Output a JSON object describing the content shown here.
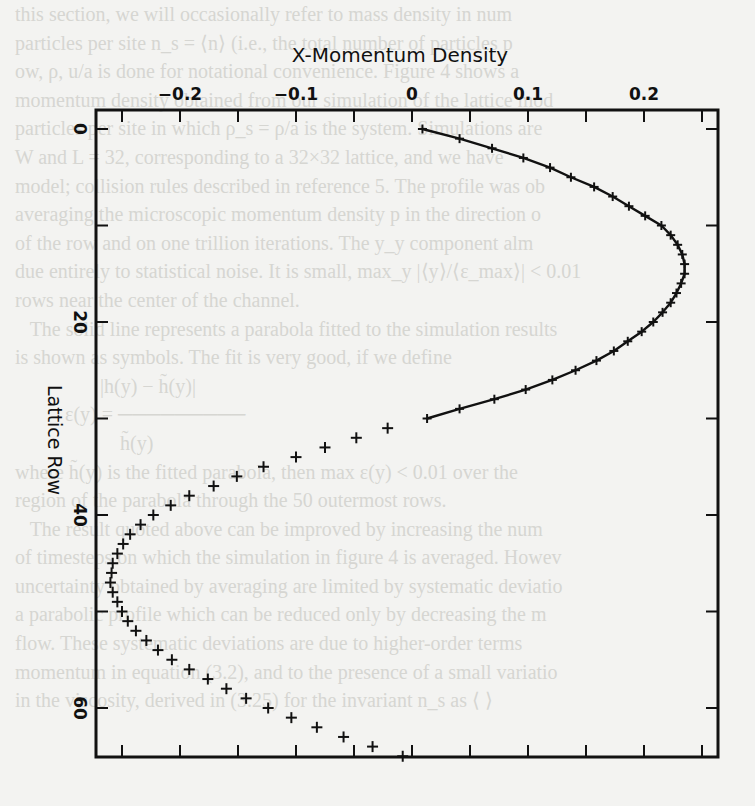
{
  "background_text": [
    "   this section, we will occasionally refer to mass density in num",
    "   particles per site n_s = ⟨n⟩ (i.e., the total number of particles p",
    "   ow, ρ, u/a is done for notational convenience. Figure 4 shows a",
    "   momentum density obtained from our simulation of the lattice mod",
    "   particles per site in which ρ_s = ρ/a is the system. Simulations are",
    "   W and L = 32, corresponding to a 32×32 lattice, and we have",
    "   model; collision rules described in reference 5. The profile was ob",
    "   averaging the microscopic momentum density p in the direction o",
    "   of the row and on one trillion iterations. The y_y component alm",
    "   due entirely to statistical noise. It is small, max_y |⟨y⟩/⟨ε_max⟩| < 0.01",
    "   rows near the center of the channel.",
    "      The solid line represents a parabola fitted to the simulation results",
    "   is shown as symbols. The fit is very good, if we define",
    "                    |h(y) − h̃(y)|",
    "             ε(y) = ─────────",
    "                        h̃(y)",
    "   where h̃(y) is the fitted parabola, then max ε(y) < 0.01 over the",
    "   region of the parabola through the 50 outermost rows.",
    "      The result quoted above can be improved by increasing the num",
    "   of timesteps on which the simulation in figure 4 is averaged. Howev",
    "   uncertainty obtained by averaging are limited by systematic deviatio",
    "   a parabolic profile which can be reduced only by decreasing the m",
    "   flow. These systematic deviations are due to higher-order terms",
    "   momentum in equation (3.2), and to the presence of a small variatio",
    "   in the viscosity, derived in (3.25) for the invariant n_s as ⟨ ⟩"
  ],
  "chart_data": {
    "type": "scatter",
    "title": "X-Momentum Density",
    "xlabel": "X-Momentum Density",
    "ylabel": "Lattice Row",
    "x_axis_position": "top",
    "y_axis_inverted": true,
    "xlim": [
      -0.265,
      0.265
    ],
    "ylim": [
      66.5,
      -2
    ],
    "xticks": [
      -0.2,
      -0.1,
      0,
      0.1,
      0.2
    ],
    "xtick_labels": [
      "-0.2",
      "-0.1",
      "0",
      "0.1",
      "0.2"
    ],
    "yticks": [
      0,
      20,
      40,
      60
    ],
    "ytick_labels": [
      "0",
      "20",
      "40",
      "60"
    ],
    "y_minor_ticks": [
      10,
      30,
      50
    ],
    "x_minor_ticks": [
      -0.25,
      -0.15,
      -0.05,
      0.05,
      0.15,
      0.25
    ],
    "grid": false,
    "legend": null,
    "series": [
      {
        "name": "simulation (fitted parabola, solid line with + markers)",
        "style": "line+markers",
        "rows": [
          0,
          1,
          2,
          3,
          4,
          5,
          6,
          7,
          8,
          9,
          10,
          11,
          12,
          13,
          14,
          15,
          16,
          17,
          18,
          19,
          20,
          21,
          22,
          23,
          24,
          25,
          26,
          27,
          28,
          29,
          30
        ],
        "values": [
          0.009,
          0.041,
          0.069,
          0.096,
          0.119,
          0.137,
          0.157,
          0.173,
          0.187,
          0.201,
          0.215,
          0.223,
          0.229,
          0.233,
          0.235,
          0.235,
          0.232,
          0.228,
          0.223,
          0.216,
          0.208,
          0.198,
          0.186,
          0.174,
          0.159,
          0.141,
          0.121,
          0.098,
          0.071,
          0.041,
          0.013
        ]
      },
      {
        "name": "simulation (+ markers only)",
        "style": "markers",
        "rows": [
          31,
          32,
          33,
          34,
          35,
          36,
          37,
          38,
          39,
          40,
          41,
          42,
          43,
          44,
          45,
          46,
          47,
          48,
          49,
          50,
          51,
          52,
          53,
          54,
          55,
          56,
          57,
          58,
          59,
          60,
          61,
          62,
          63,
          64,
          65
        ],
        "values": [
          -0.021,
          -0.048,
          -0.075,
          -0.1,
          -0.128,
          -0.151,
          -0.171,
          -0.192,
          -0.208,
          -0.223,
          -0.234,
          -0.243,
          -0.249,
          -0.254,
          -0.258,
          -0.259,
          -0.26,
          -0.258,
          -0.254,
          -0.25,
          -0.245,
          -0.238,
          -0.229,
          -0.219,
          -0.207,
          -0.192,
          -0.176,
          -0.16,
          -0.143,
          -0.124,
          -0.104,
          -0.082,
          -0.059,
          -0.034,
          -0.008
        ]
      }
    ]
  },
  "axes": {
    "title": "X-Momentum Density",
    "ylabel": "Lattice Row",
    "xtick_labels": [
      "-0.2",
      "-0.1",
      "0",
      "0.1",
      "0.2"
    ],
    "ytick_labels": [
      "0",
      "20",
      "40",
      "60"
    ]
  }
}
